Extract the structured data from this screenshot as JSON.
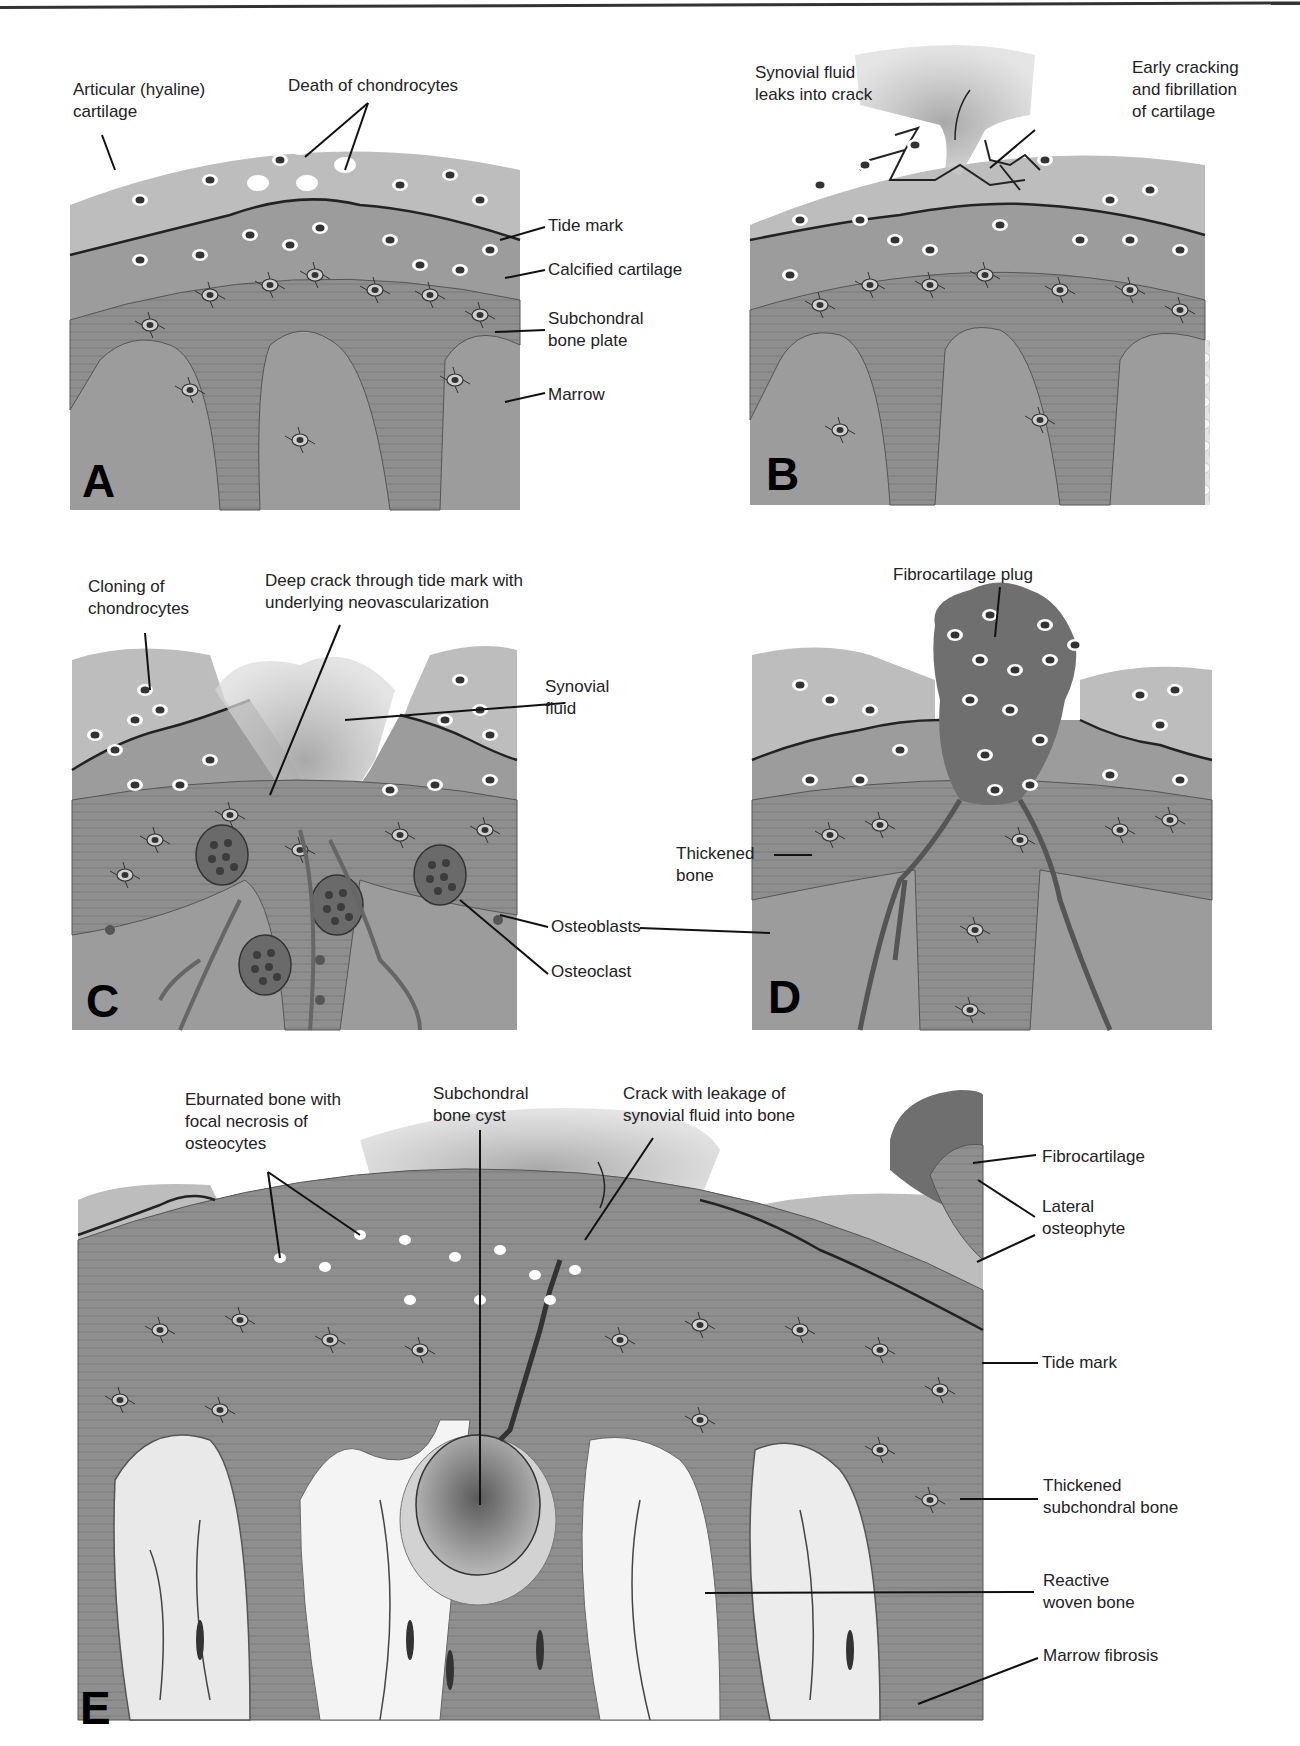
{
  "figure": {
    "colors": {
      "cartilage_light": "#bdbdbd",
      "calcified_cartilage": "#9c9c9c",
      "bone": "#8e8e8e",
      "marrow": "#e6e6e6",
      "fibrocartilage": "#6f6f6f",
      "synovial_fluid": "#c8c8c8",
      "line": "#222222"
    },
    "panels": [
      {
        "id": "A",
        "letter": "A",
        "labels": {
          "articular_cartilage": "Articular (hyaline)\ncartilage",
          "death_chondrocytes": "Death of chondrocytes",
          "tide_mark": "Tide mark",
          "calcified_cartilage": "Calcified cartilage",
          "subchondral_plate": "Subchondral\nbone plate",
          "marrow": "Marrow"
        }
      },
      {
        "id": "B",
        "letter": "B",
        "labels": {
          "synovial_leak": "Synovial fluid\nleaks into crack",
          "early_cracking": "Early cracking\nand fibrillation\nof cartilage"
        }
      },
      {
        "id": "C",
        "letter": "C",
        "labels": {
          "cloning": "Cloning of\nchondrocytes",
          "deep_crack": "Deep crack through tide mark with\nunderlying neovascularization",
          "synovial_fluid": "Synovial\nfluid",
          "osteoblasts": "Osteoblasts",
          "osteoclast": "Osteoclast"
        }
      },
      {
        "id": "D",
        "letter": "D",
        "labels": {
          "fibro_plug": "Fibrocartilage plug",
          "thickened_bone": "Thickened\nbone"
        }
      },
      {
        "id": "E",
        "letter": "E",
        "labels": {
          "eburnated": "Eburnated bone with\nfocal necrosis of\nosteocytes",
          "bone_cyst": "Subchondral\nbone cyst",
          "crack_leakage": "Crack with leakage of\nsynovial fluid into bone",
          "fibrocartilage": "Fibrocartilage",
          "lateral_osteophyte": "Lateral\nosteophyte",
          "tide_mark": "Tide mark",
          "thickened_subchondral": "Thickened\nsubchondral bone",
          "reactive_woven": "Reactive\nwoven bone",
          "marrow_fibrosis": "Marrow fibrosis"
        }
      }
    ]
  }
}
